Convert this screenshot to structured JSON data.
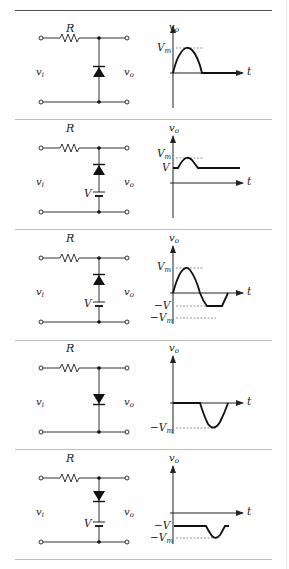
{
  "figure": {
    "colors": {
      "line": "#333333",
      "separator": "#bdbdbd",
      "top_rule": "#555555",
      "dashed": "#777777"
    }
  },
  "rows": [
    {
      "circuit": {
        "resistor_label": "R",
        "input_label": "v",
        "input_sub": "i",
        "output_label": "v",
        "output_sub": "o",
        "diode_direction": "up",
        "battery": false,
        "battery_label": ""
      },
      "graph": {
        "y_axis_label": "v",
        "y_axis_sub": "o",
        "x_axis_label": "t",
        "levels": [
          {
            "label": "V",
            "sub": "m",
            "value": "Vm"
          }
        ],
        "waveform": "positive half-sine, then zero"
      }
    },
    {
      "circuit": {
        "resistor_label": "R",
        "input_label": "v",
        "input_sub": "i",
        "output_label": "v",
        "output_sub": "o",
        "diode_direction": "up",
        "battery": true,
        "battery_label": "V"
      },
      "graph": {
        "y_axis_label": "v",
        "y_axis_sub": "o",
        "x_axis_label": "t",
        "levels": [
          {
            "label": "V",
            "sub": "m",
            "value": "Vm"
          },
          {
            "label": "V",
            "sub": "",
            "value": "V"
          }
        ],
        "waveform": "clamped at V, bump to Vm"
      }
    },
    {
      "circuit": {
        "resistor_label": "R",
        "input_label": "v",
        "input_sub": "i",
        "output_label": "v",
        "output_sub": "o",
        "diode_direction": "up",
        "battery": true,
        "battery_label": "V"
      },
      "graph": {
        "y_axis_label": "v",
        "y_axis_sub": "o",
        "x_axis_label": "t",
        "levels": [
          {
            "label": "V",
            "sub": "m",
            "value": "Vm"
          },
          {
            "label": "−V",
            "sub": "",
            "value": "-V"
          },
          {
            "label": "−V",
            "sub": "m",
            "value": "-Vm"
          }
        ],
        "waveform": "full positive half, negative clipped at -V"
      }
    },
    {
      "circuit": {
        "resistor_label": "R",
        "input_label": "v",
        "input_sub": "i",
        "output_label": "v",
        "output_sub": "o",
        "diode_direction": "down",
        "battery": false,
        "battery_label": ""
      },
      "graph": {
        "y_axis_label": "v",
        "y_axis_sub": "o",
        "x_axis_label": "t",
        "levels": [
          {
            "label": "−V",
            "sub": "m",
            "value": "-Vm"
          }
        ],
        "waveform": "zero, then negative half-sine"
      }
    },
    {
      "circuit": {
        "resistor_label": "R",
        "input_label": "v",
        "input_sub": "i",
        "output_label": "v",
        "output_sub": "o",
        "diode_direction": "down",
        "battery": true,
        "battery_label": "V"
      },
      "graph": {
        "y_axis_label": "v",
        "y_axis_sub": "o",
        "x_axis_label": "t",
        "levels": [
          {
            "label": "−V",
            "sub": "",
            "value": "-V"
          },
          {
            "label": "−V",
            "sub": "m",
            "value": "-Vm"
          }
        ],
        "waveform": "clamped at -V, dip to -Vm"
      }
    }
  ]
}
